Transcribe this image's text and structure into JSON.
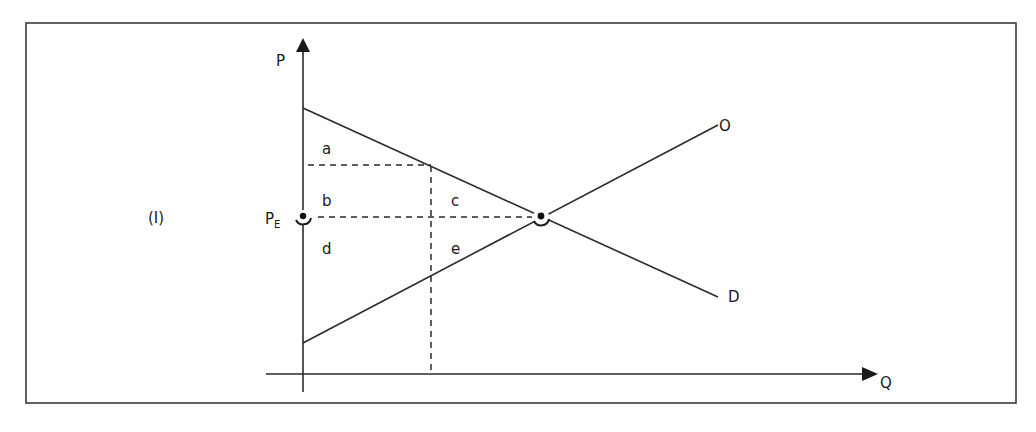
{
  "figure": {
    "panel_label": "(I)",
    "axes": {
      "y_label": "P",
      "x_label": "Q"
    },
    "price_marker": {
      "label": "P",
      "subscript": "E"
    },
    "curves": [
      {
        "name": "O",
        "label": "O",
        "type": "supply",
        "direction": "upward-sloping"
      },
      {
        "name": "D",
        "label": "D",
        "type": "demand",
        "direction": "downward-sloping"
      }
    ],
    "regions": [
      {
        "id": "a",
        "label": "a"
      },
      {
        "id": "b",
        "label": "b"
      },
      {
        "id": "c",
        "label": "c"
      },
      {
        "id": "d",
        "label": "d"
      },
      {
        "id": "e",
        "label": "e"
      }
    ],
    "colors": {
      "line": "#2a2a2a",
      "background": "#ffffff"
    }
  }
}
